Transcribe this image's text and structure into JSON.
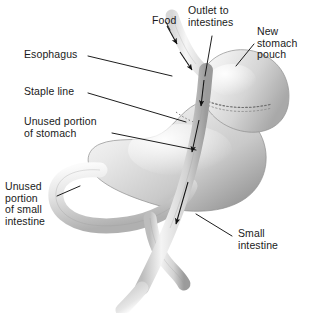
{
  "diagram": {
    "background_color": "#ffffff",
    "line_color": "#111111",
    "tissue_light": "#f2f2f2",
    "tissue_mid": "#d9d9d9",
    "tissue_dark": "#a8a8a8"
  },
  "labels": {
    "food": "Food",
    "esophagus": "Esophagus",
    "outlet_to_intestines": "Outlet to\nintestines",
    "new_stomach_pouch": "New\nstomach\npouch",
    "staple_line": "Staple line",
    "unused_portion_of_stomach": "Unused portion\nof stomach",
    "unused_portion_of_small_intestine": "Unused\nportion\nof small\nintestine",
    "small_intestine": "Small\nintestine"
  },
  "parts": [
    "esophagus",
    "new-stomach-pouch",
    "staple-line",
    "unused-stomach",
    "duodenal-loop",
    "roux-limb-small-intestine"
  ],
  "flow_arrows": [
    "food-down-esophagus-upper",
    "food-down-esophagus-lower",
    "intestine-flow-upper",
    "intestine-flow-middle",
    "intestine-flow-lower"
  ]
}
